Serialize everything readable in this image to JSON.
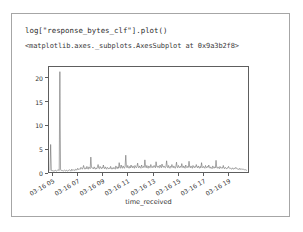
{
  "notebook": {
    "code_input": "log[\"response_bytes_clf\"].plot()",
    "output_repr": "<matplotlib.axes._subplots.AxesSubplot at 0x9a3b2f8>"
  },
  "colors": {
    "line": "#6d6d6d",
    "axis": "#5e5e5e",
    "text": "#333333",
    "frame": "#a6a6a6",
    "background": "#ffffff"
  },
  "chart_data": {
    "type": "line",
    "title": "",
    "xlabel": "time_received",
    "ylabel": "",
    "ylim": [
      0,
      22.5
    ],
    "yticks": [
      0,
      5,
      10,
      15,
      20
    ],
    "ytick_labels": [
      "0",
      "5",
      "10",
      "15",
      "20"
    ],
    "xtick_labels": [
      "03-16 05",
      "03-16 07",
      "03-16 09",
      "03-16 11",
      "03-16 13",
      "03-16 15",
      "03-16 17",
      "03-16 19"
    ],
    "xtick_positions": [
      0.02,
      0.145,
      0.27,
      0.395,
      0.52,
      0.645,
      0.77,
      0.895
    ],
    "grid": false,
    "legend": false,
    "series": [
      {
        "name": "response_bytes_clf",
        "values": [
          0.3,
          5.9,
          0.4,
          0.2,
          0.3,
          0.2,
          0.3,
          0.2,
          0.4,
          0.3,
          0.2,
          0.3,
          0.5,
          0.4,
          0.3,
          21.5,
          0.5,
          0.3,
          0.4,
          0.3,
          0.2,
          0.3,
          0.4,
          0.3,
          0.2,
          0.4,
          0.3,
          0.2,
          0.3,
          0.5,
          0.4,
          0.3,
          0.2,
          0.6,
          0.4,
          0.3,
          0.5,
          0.4,
          0.3,
          0.6,
          0.5,
          0.4,
          0.8,
          0.6,
          0.5,
          0.7,
          0.6,
          1.0,
          0.8,
          0.6,
          0.9,
          1.4,
          0.8,
          0.6,
          0.9,
          0.7,
          1.2,
          0.8,
          0.6,
          1.1,
          0.9,
          0.7,
          3.2,
          1.0,
          0.8,
          0.9,
          0.7,
          1.1,
          0.8,
          0.6,
          0.9,
          0.7,
          1.0,
          1.6,
          0.8,
          0.7,
          1.2,
          0.9,
          0.7,
          1.0,
          0.8,
          1.5,
          0.9,
          0.7,
          1.1,
          0.8,
          0.6,
          1.0,
          0.8,
          0.7,
          0.9,
          0.7,
          1.2,
          0.8,
          0.6,
          0.9,
          0.7,
          1.0,
          0.8,
          0.6,
          1.3,
          0.9,
          0.7,
          1.1,
          0.8,
          2.0,
          1.0,
          0.8,
          1.5,
          1.0,
          0.8,
          1.3,
          1.0,
          0.8,
          1.2,
          3.6,
          1.1,
          0.9,
          1.4,
          1.0,
          0.8,
          1.2,
          0.9,
          1.5,
          1.1,
          0.9,
          1.3,
          1.0,
          0.8,
          1.4,
          1.1,
          0.9,
          1.2,
          1.9,
          1.0,
          0.9,
          1.3,
          1.0,
          0.8,
          1.5,
          1.1,
          0.9,
          1.2,
          1.0,
          2.6,
          1.2,
          0.9,
          1.4,
          1.0,
          0.8,
          1.3,
          1.0,
          0.9,
          1.6,
          1.1,
          0.9,
          1.2,
          1.0,
          1.4,
          1.1,
          0.9,
          2.2,
          1.2,
          1.0,
          1.3,
          1.0,
          0.9,
          1.5,
          1.1,
          0.9,
          1.7,
          1.2,
          1.0,
          1.3,
          1.0,
          0.9,
          1.2,
          2.4,
          1.1,
          0.9,
          1.4,
          1.0,
          0.8,
          1.2,
          1.0,
          1.6,
          1.1,
          0.9,
          1.3,
          1.0,
          0.8,
          1.2,
          2.1,
          1.0,
          0.9,
          1.4,
          1.1,
          0.9,
          1.2,
          1.0,
          1.8,
          1.1,
          0.9,
          1.3,
          1.0,
          0.8,
          1.5,
          1.1,
          0.9,
          1.2,
          1.0,
          2.3,
          1.1,
          0.9,
          1.3,
          1.0,
          0.8,
          1.4,
          1.1,
          0.9,
          1.2,
          1.0,
          1.6,
          1.1,
          0.9,
          1.3,
          1.0,
          0.8,
          1.2,
          0.9,
          2.0,
          1.1,
          0.9,
          1.2,
          1.0,
          0.8,
          1.4,
          1.0,
          0.9,
          1.2,
          1.0,
          1.5,
          1.0,
          0.8,
          1.1,
          0.9,
          0.7,
          1.3,
          1.0,
          0.8,
          1.1,
          0.9,
          2.5,
          1.0,
          0.8,
          1.1,
          0.9,
          0.7,
          1.2,
          0.9,
          0.8,
          1.0,
          0.8,
          1.4,
          0.9,
          0.7,
          1.0,
          0.8,
          0.7,
          0.9,
          0.8,
          1.2,
          0.9,
          0.7,
          0.8,
          0.7,
          0.6,
          0.9,
          0.7,
          0.6,
          0.8,
          0.7,
          1.0,
          0.8,
          0.6,
          0.7,
          0.6,
          0.5,
          0.8,
          0.6,
          0.5,
          0.7,
          0.6,
          0.5,
          0.6,
          0.5,
          0.4,
          0.5,
          0.4,
          0.3
        ]
      }
    ]
  }
}
